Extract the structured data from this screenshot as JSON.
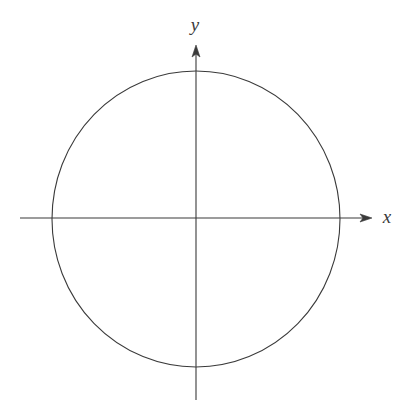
{
  "figure": {
    "kind": "geometry-diagram",
    "background_color": "#ffffff",
    "stroke_color": "#3a3a3a",
    "stroke_width": 1.1,
    "canvas": {
      "width": 412,
      "height": 418
    }
  },
  "axes": {
    "origin": {
      "x": 196,
      "y": 218
    },
    "x_axis": {
      "label": "x",
      "label_position": {
        "x": 387,
        "y": 219
      },
      "start": {
        "x": 20,
        "y": 218
      },
      "end": {
        "x": 372,
        "y": 218
      },
      "arrow": "right",
      "arrow_tip": {
        "x": 372,
        "y": 218
      }
    },
    "y_axis": {
      "label": "y",
      "label_position": {
        "x": 195,
        "y": 27
      },
      "start": {
        "x": 196,
        "y": 400
      },
      "end": {
        "x": 196,
        "y": 45
      },
      "arrow": "up",
      "arrow_tip": {
        "x": 196,
        "y": 45
      }
    }
  },
  "shapes": [
    {
      "name": "circle",
      "type": "ellipse",
      "center": {
        "x": 196,
        "y": 219
      },
      "rx": 144,
      "ry": 148,
      "fill": "none",
      "stroke": "#3a3a3a"
    }
  ],
  "intersections": [
    {
      "name": "right-intercept",
      "x": 340,
      "y": 219
    },
    {
      "name": "left-intercept",
      "x": 52,
      "y": 219
    },
    {
      "name": "top-intercept",
      "x": 196,
      "y": 71
    },
    {
      "name": "bottom-intercept",
      "x": 196,
      "y": 367
    }
  ]
}
